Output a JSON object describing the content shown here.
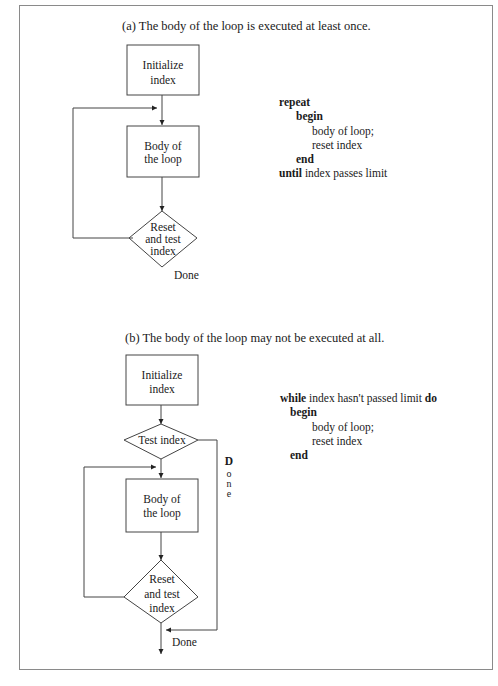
{
  "part_a": {
    "caption": "(a) The body of the loop is executed at least once.",
    "nodes": {
      "init": [
        "Initialize",
        "index"
      ],
      "body": [
        "Body of",
        "the loop"
      ],
      "reset": [
        "Reset",
        "and test",
        "index"
      ]
    },
    "exit_label": "Done",
    "code": {
      "line1_kw": "repeat",
      "line2_kw": "begin",
      "line3": "body of loop;",
      "line4": "reset index",
      "line5_kw": "end",
      "line6_kw": "until",
      "line6_rest": " index passes limit"
    }
  },
  "part_b": {
    "caption": "(b) The body of the loop may not be executed at all.",
    "nodes": {
      "init": [
        "Initialize",
        "index"
      ],
      "test": [
        "Test index"
      ],
      "body": [
        "Body of",
        "the loop"
      ],
      "reset": [
        "Reset",
        "and test",
        "index"
      ]
    },
    "side_label": [
      "D",
      "o",
      "n",
      "e"
    ],
    "exit_label": "Done",
    "code": {
      "line1_kw": "while",
      "line1_mid": " index hasn't passed limit ",
      "line1_kw2": "do",
      "line2_kw": "begin",
      "line3": "body of loop;",
      "line4": "reset index",
      "line5_kw": "end"
    }
  }
}
